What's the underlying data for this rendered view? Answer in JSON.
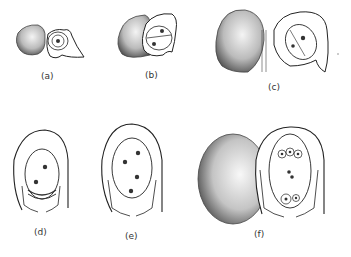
{
  "figure": {
    "panels": [
      {
        "id": "a",
        "label": "(a)",
        "stage": "megaspore mother cell",
        "nuclei": 1
      },
      {
        "id": "b",
        "label": "(b)",
        "stage": "2-nucleate",
        "nuclei": 2
      },
      {
        "id": "c",
        "label": "(c)",
        "stage": "2-nucleate embryo sac",
        "nuclei": 2
      },
      {
        "id": "d",
        "label": "(d)",
        "stage": "2-nucleate embryo sac",
        "nuclei": 2
      },
      {
        "id": "e",
        "label": "(e)",
        "stage": "4-nucleate embryo sac",
        "nuclei": 4
      },
      {
        "id": "f",
        "label": "(f)",
        "stage": "mature 8-nucleate embryo sac",
        "nuclei": 8
      }
    ]
  },
  "colors": {
    "line": "#222222",
    "shade": "#555555",
    "background": "#ffffff"
  }
}
